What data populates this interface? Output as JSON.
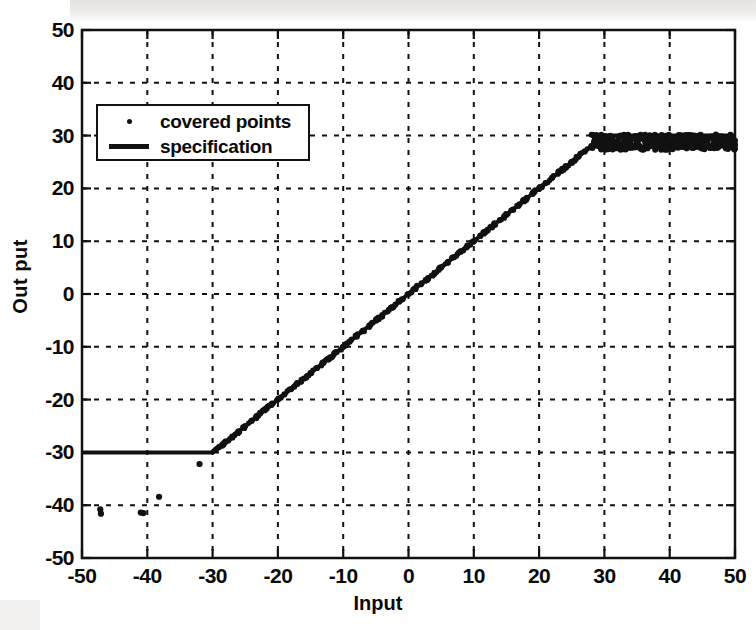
{
  "chart_data": {
    "type": "scatter",
    "title": "",
    "xlabel": "Input",
    "ylabel": "Out put",
    "xlim": [
      -50,
      50
    ],
    "ylim": [
      -50,
      50
    ],
    "xticks": [
      -50,
      -40,
      -30,
      -20,
      -10,
      0,
      10,
      20,
      30,
      40,
      50
    ],
    "yticks": [
      -50,
      -40,
      -30,
      -20,
      -10,
      0,
      10,
      20,
      30,
      40,
      50
    ],
    "xtick_labels": [
      "-50",
      "-40",
      "-30",
      "-20",
      "-10",
      "0",
      "10",
      "20",
      "30",
      "40",
      "50"
    ],
    "ytick_labels": [
      "-50",
      "-40",
      "-30",
      "-20",
      "-10",
      "0",
      "10",
      "20",
      "30",
      "40",
      "50"
    ],
    "grid": true,
    "grid_style": "dashed",
    "legend_position": "upper left",
    "series": [
      {
        "name": "covered points",
        "type": "scatter",
        "marker": "dot",
        "color": "#111111",
        "description": "Measured samples; tightly follow the specification in the linear region, scatter below the lower clamp on the far left and jitter 27-31 above the upper clamp on the right.",
        "points": [
          [
            -47.2,
            -40.8
          ],
          [
            -47.1,
            -41.6
          ],
          [
            -41.0,
            -41.4
          ],
          [
            -40.6,
            -41.5
          ],
          [
            -38.2,
            -38.4
          ],
          [
            -32.0,
            -32.2
          ],
          [
            -29.5,
            -29.5
          ],
          [
            -29.0,
            -29.0
          ],
          [
            -28.5,
            -28.5
          ],
          [
            -28.0,
            -28.0
          ],
          [
            -27.0,
            -27.0
          ],
          [
            -26.0,
            -26.0
          ],
          [
            -25.0,
            -25.0
          ],
          [
            -24.0,
            -24.0
          ],
          [
            -23.0,
            -23.0
          ],
          [
            -22.0,
            -22.0
          ],
          [
            -21.0,
            -21.0
          ],
          [
            -20.0,
            -20.0
          ],
          [
            -19.0,
            -19.0
          ],
          [
            -18.0,
            -18.0
          ],
          [
            -17.0,
            -17.0
          ],
          [
            -16.0,
            -16.0
          ],
          [
            -15.0,
            -15.0
          ],
          [
            -14.0,
            -14.0
          ],
          [
            -13.0,
            -13.0
          ],
          [
            -12.0,
            -12.0
          ],
          [
            -11.0,
            -11.0
          ],
          [
            -10.0,
            -10.0
          ],
          [
            -9.0,
            -9.0
          ],
          [
            -8.0,
            -8.0
          ],
          [
            -7.0,
            -7.0
          ],
          [
            -6.0,
            -6.0
          ],
          [
            -5.0,
            -5.0
          ],
          [
            -4.0,
            -4.0
          ],
          [
            -3.0,
            -3.0
          ],
          [
            -2.0,
            -2.0
          ],
          [
            -1.0,
            -1.0
          ],
          [
            0.0,
            0.0
          ],
          [
            1.0,
            1.0
          ],
          [
            2.0,
            2.0
          ],
          [
            3.0,
            3.0
          ],
          [
            4.0,
            4.0
          ],
          [
            5.0,
            5.0
          ],
          [
            6.0,
            6.0
          ],
          [
            7.0,
            7.0
          ],
          [
            8.0,
            8.0
          ],
          [
            9.0,
            9.0
          ],
          [
            10.0,
            10.0
          ],
          [
            11.0,
            11.0
          ],
          [
            12.0,
            12.0
          ],
          [
            13.0,
            13.0
          ],
          [
            14.0,
            14.0
          ],
          [
            15.0,
            15.0
          ],
          [
            16.0,
            16.0
          ],
          [
            17.0,
            17.0
          ],
          [
            18.0,
            18.0
          ],
          [
            19.0,
            19.0
          ],
          [
            20.0,
            20.0
          ],
          [
            21.0,
            21.0
          ],
          [
            22.0,
            22.0
          ],
          [
            23.0,
            23.0
          ],
          [
            24.0,
            24.0
          ],
          [
            25.0,
            25.0
          ],
          [
            26.0,
            26.0
          ],
          [
            27.0,
            27.0
          ],
          [
            28.0,
            28.0
          ],
          [
            28.8,
            29.2
          ],
          [
            29.4,
            28.3
          ],
          [
            30.0,
            29.6
          ],
          [
            30.6,
            27.8
          ],
          [
            31.2,
            29.4
          ],
          [
            31.8,
            27.6
          ],
          [
            32.4,
            29.8
          ],
          [
            33.0,
            27.9
          ],
          [
            33.6,
            29.3
          ],
          [
            34.2,
            27.7
          ],
          [
            34.8,
            29.9
          ],
          [
            35.4,
            28.0
          ],
          [
            36.0,
            29.5
          ],
          [
            36.6,
            27.6
          ],
          [
            37.2,
            29.7
          ],
          [
            37.8,
            27.8
          ],
          [
            38.4,
            29.4
          ],
          [
            39.0,
            28.1
          ],
          [
            39.6,
            29.8
          ],
          [
            40.2,
            27.7
          ],
          [
            40.8,
            29.5
          ],
          [
            41.4,
            27.9
          ],
          [
            42.0,
            29.9
          ],
          [
            42.6,
            27.6
          ],
          [
            43.2,
            29.3
          ],
          [
            43.8,
            28.2
          ],
          [
            44.4,
            29.7
          ],
          [
            45.0,
            27.8
          ],
          [
            45.6,
            29.6
          ],
          [
            46.2,
            27.7
          ],
          [
            46.8,
            29.4
          ],
          [
            47.4,
            28.0
          ],
          [
            48.0,
            29.8
          ],
          [
            48.6,
            27.6
          ],
          [
            49.2,
            29.5
          ],
          [
            49.8,
            27.9
          ]
        ]
      },
      {
        "name": "specification",
        "type": "line",
        "color": "#111111",
        "description": "Piecewise-linear saturating specification: clamped at -30 for input below -30, unity slope between -30 and 30, clamped at +30 above 30.",
        "points": [
          [
            -50,
            -30
          ],
          [
            -30,
            -30
          ],
          [
            30,
            30
          ],
          [
            50,
            30
          ]
        ]
      }
    ]
  },
  "legend": {
    "items": [
      {
        "label": "covered points",
        "key": "dot"
      },
      {
        "label": "specification",
        "key": "line"
      }
    ]
  },
  "axes": {
    "xlabel": "Input",
    "ylabel": "Out put"
  }
}
